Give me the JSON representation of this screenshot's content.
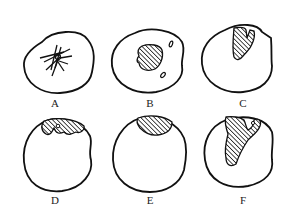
{
  "figure": {
    "panels": [
      {
        "id": "A",
        "label": "A",
        "description": "circle with radiating crossed lines (star-like fibers) in center"
      },
      {
        "id": "B",
        "label": "B",
        "description": "circle with central hatched mass and two small satellite spots"
      },
      {
        "id": "C",
        "label": "C",
        "description": "circle with hatched forked region extending from top"
      },
      {
        "id": "D",
        "label": "D",
        "description": "circle with hatched irregular cap band along top edge"
      },
      {
        "id": "E",
        "label": "E",
        "description": "circle with hatched crescent cap at top"
      },
      {
        "id": "F",
        "label": "F",
        "description": "circle with large hatched irregular region descending from top"
      }
    ],
    "colors": {
      "stroke": "#111111",
      "background": "#ffffff"
    }
  }
}
